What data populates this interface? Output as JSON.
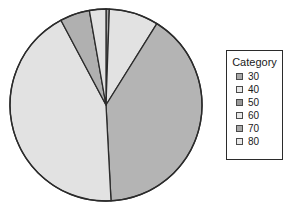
{
  "chart_data": {
    "type": "pie",
    "title": "",
    "legend_title": "Category",
    "legend_position": "right",
    "categories": [
      "30",
      "40",
      "50",
      "60",
      "70",
      "80"
    ],
    "values": [
      2,
      30,
      145,
      155,
      18,
      10
    ],
    "units": "degrees",
    "slices": [
      {
        "label": "30",
        "start_angle": 0,
        "end_angle": 2,
        "sweep": 2,
        "color": "#a8a8a8",
        "percent": 0.6
      },
      {
        "label": "40",
        "start_angle": 2,
        "end_angle": 32,
        "sweep": 30,
        "color": "#e2e2e2",
        "percent": 8.3
      },
      {
        "label": "50",
        "start_angle": 32,
        "end_angle": 177,
        "sweep": 145,
        "color": "#b4b4b4",
        "percent": 40.3
      },
      {
        "label": "60",
        "start_angle": 177,
        "end_angle": 332,
        "sweep": 155,
        "color": "#e2e2e2",
        "percent": 43.1
      },
      {
        "label": "70",
        "start_angle": 332,
        "end_angle": 350,
        "sweep": 18,
        "color": "#b0b0b0",
        "percent": 5.0
      },
      {
        "label": "80",
        "start_angle": 350,
        "end_angle": 360,
        "sweep": 10,
        "color": "#e2e2e2",
        "percent": 2.8
      }
    ],
    "geometry": {
      "center_x": 106,
      "center_y": 105,
      "radius": 96
    },
    "stroke_color": "#2b2b2b",
    "background": "#ffffff"
  },
  "legend": {
    "title": "Category",
    "items": [
      {
        "label": "30",
        "color": "#a8a8a8"
      },
      {
        "label": "40",
        "color": "#e8e8e8"
      },
      {
        "label": "50",
        "color": "#989898"
      },
      {
        "label": "60",
        "color": "#e8e8e8"
      },
      {
        "label": "70",
        "color": "#a8a8a8"
      },
      {
        "label": "80",
        "color": "#e8e8e8"
      }
    ]
  }
}
